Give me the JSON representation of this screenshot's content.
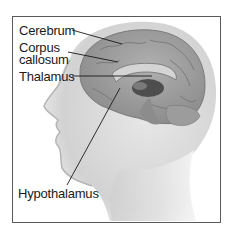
{
  "diagram": {
    "labels": [
      {
        "id": "cerebrum",
        "text": "Cerebrum"
      },
      {
        "id": "corpus-callosum",
        "line1": "Corpus",
        "line2": "callosum"
      },
      {
        "id": "thalamus",
        "text": "Thalamus"
      },
      {
        "id": "hypothalamus",
        "text": "Hypothalamus"
      }
    ],
    "colors": {
      "frame": "#5a5a5a",
      "skin": "#d9d9d9",
      "brain": "#9a9a9a",
      "leader_lines": "#1a1a1a"
    }
  }
}
